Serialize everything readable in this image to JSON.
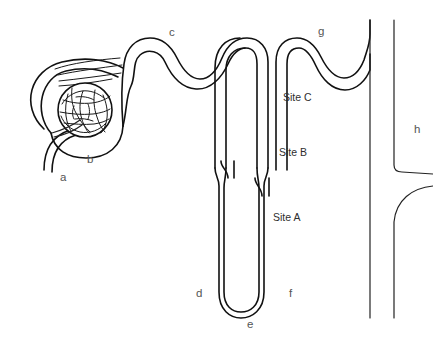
{
  "figure": {
    "type": "line-diagram",
    "background_color": "#ffffff",
    "stroke_color": "#111111"
  },
  "labels": {
    "a": "a",
    "b": "b",
    "c": "c",
    "d": "d",
    "e": "e",
    "f": "f",
    "g": "g",
    "h": "h",
    "site_a": "Site A",
    "site_b": "Site B",
    "site_c": "Site C"
  },
  "parts": [
    {
      "key": "a",
      "label": "a",
      "x": 63,
      "y": 178
    },
    {
      "key": "b",
      "label": "b",
      "x": 90,
      "y": 160
    },
    {
      "key": "c",
      "label": "c",
      "x": 172,
      "y": 32
    },
    {
      "key": "d",
      "label": "d",
      "x": 199,
      "y": 293
    },
    {
      "key": "e",
      "label": "e",
      "x": 250,
      "y": 324
    },
    {
      "key": "f",
      "label": "f",
      "x": 292,
      "y": 293
    },
    {
      "key": "g",
      "label": "g",
      "x": 321,
      "y": 32
    },
    {
      "key": "h",
      "label": "h",
      "x": 417,
      "y": 129
    }
  ],
  "sites": [
    {
      "key": "site_c",
      "label": "Site C",
      "x": 283,
      "y": 92
    },
    {
      "key": "site_b",
      "label": "Site B",
      "x": 279,
      "y": 147
    },
    {
      "key": "site_a",
      "label": "Site A",
      "x": 273,
      "y": 212
    }
  ]
}
